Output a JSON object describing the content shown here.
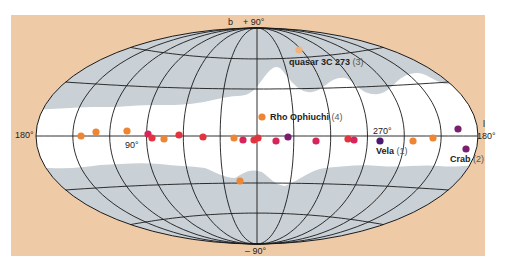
{
  "figure": {
    "projection": "Aitoff / Hammer (galactic coordinates)",
    "colors": {
      "panel": "#efcaa6",
      "sky_white": "#ffffff",
      "sky_gray": "#c9d0d6",
      "grid": "#1a1a1a",
      "orange": "#ee8532",
      "red": "#e2343e",
      "magenta": "#d8245a",
      "purple": "#7a1f6e",
      "dark_purple": "#4b1a6d",
      "light_orange": "#f2b37a"
    },
    "axis_labels": {
      "b_symbol": "b",
      "north_pole": "+ 90°",
      "south_pole": "– 90°",
      "l_symbol": "l",
      "left_180": "180°",
      "right_180": "180°",
      "lon_90": "90°",
      "lon_270": "270°"
    },
    "sources": [
      {
        "name": "quasar 3C 273",
        "number": "(3)"
      },
      {
        "name": "Rho Ophiuchi",
        "number": "(4)"
      },
      {
        "name": "Vela",
        "number": "(1)"
      },
      {
        "name": "Crab",
        "number": "(2)"
      }
    ]
  },
  "chart_data": {
    "type": "scatter",
    "title": "",
    "xlabel": "l (galactic longitude)",
    "ylabel": "b (galactic latitude)",
    "x_ticks": [
      "180°",
      "90°",
      "0°",
      "270°",
      "180°"
    ],
    "y_ticks": [
      "+ 90°",
      "0°",
      "– 90°"
    ],
    "grid": true,
    "points": [
      {
        "px": 81,
        "py": 136,
        "color": "orange"
      },
      {
        "px": 96,
        "py": 132,
        "color": "orange"
      },
      {
        "px": 127,
        "py": 131,
        "color": "orange"
      },
      {
        "px": 148,
        "py": 134,
        "color": "magenta"
      },
      {
        "px": 152,
        "py": 138,
        "color": "red"
      },
      {
        "px": 164,
        "py": 139,
        "color": "orange"
      },
      {
        "px": 179,
        "py": 135,
        "color": "red"
      },
      {
        "px": 203,
        "py": 137,
        "color": "red"
      },
      {
        "px": 234,
        "py": 138,
        "color": "orange"
      },
      {
        "px": 243,
        "py": 140,
        "color": "magenta"
      },
      {
        "px": 254,
        "py": 140,
        "color": "red"
      },
      {
        "px": 258,
        "py": 138,
        "color": "red"
      },
      {
        "px": 276,
        "py": 141,
        "color": "magenta"
      },
      {
        "px": 288,
        "py": 137,
        "color": "purple"
      },
      {
        "px": 316,
        "py": 141,
        "color": "magenta"
      },
      {
        "px": 348,
        "py": 139,
        "color": "red"
      },
      {
        "px": 354,
        "py": 140,
        "color": "magenta"
      },
      {
        "px": 380,
        "py": 141,
        "color": "dark_purple",
        "label": "Vela (1)"
      },
      {
        "px": 413,
        "py": 141,
        "color": "orange"
      },
      {
        "px": 433,
        "py": 138,
        "color": "orange"
      },
      {
        "px": 458,
        "py": 129,
        "color": "purple"
      },
      {
        "px": 466,
        "py": 149,
        "color": "purple",
        "label": "Crab (2)"
      },
      {
        "px": 240,
        "py": 181,
        "color": "orange"
      },
      {
        "px": 299,
        "py": 50,
        "color": "light_orange",
        "label": "quasar 3C 273 (3)"
      },
      {
        "px": 262,
        "py": 117,
        "color": "orange",
        "label": "Rho Ophiuchi (4)"
      }
    ]
  }
}
